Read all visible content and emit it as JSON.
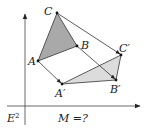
{
  "diagram": {
    "space_label": "E",
    "space_exponent": "2",
    "question": "M =?",
    "points": {
      "A": {
        "label": "A",
        "x": 38,
        "y": 61
      },
      "B": {
        "label": "B",
        "x": 77,
        "y": 46
      },
      "C": {
        "label": "C",
        "x": 57,
        "y": 13
      },
      "A_prime": {
        "label": "A′",
        "x": 62,
        "y": 84
      },
      "B_prime": {
        "label": "B′",
        "x": 116,
        "y": 80
      },
      "C_prime": {
        "label": "C′",
        "x": 121,
        "y": 55
      }
    },
    "colors": {
      "original_fill": "#a9a9a9",
      "image_fill": "#dcdcdc",
      "stroke": "#333333"
    }
  }
}
